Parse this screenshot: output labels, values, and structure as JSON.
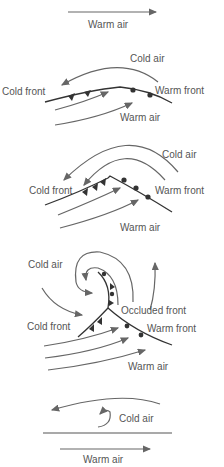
{
  "diagram": {
    "panels": [
      {
        "stage": 1,
        "labels": {
          "warm_air": "Warm air"
        }
      },
      {
        "stage": 2,
        "labels": {
          "cold_air": "Cold air",
          "cold_front": "Cold front",
          "warm_front": "Warm front",
          "warm_air": "Warm air"
        }
      },
      {
        "stage": 3,
        "labels": {
          "cold_air": "Cold air",
          "cold_front": "Cold front",
          "warm_front": "Warm front",
          "warm_air": "Warm air"
        }
      },
      {
        "stage": 4,
        "labels": {
          "cold_air": "Cold air",
          "occluded_front": "Occluded front",
          "cold_front": "Cold front",
          "warm_front": "Warm front",
          "warm_air": "Warm air"
        }
      },
      {
        "stage": 5,
        "labels": {
          "cold_air": "Cold air",
          "warm_air": "Warm air"
        }
      }
    ],
    "colors": {
      "line": "#666666",
      "front": "#333333",
      "text": "#555555"
    }
  }
}
